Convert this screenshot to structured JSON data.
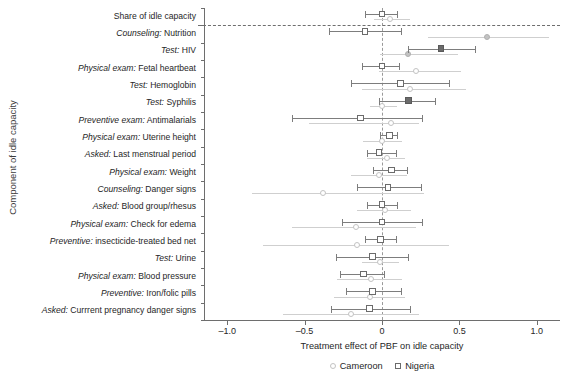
{
  "chart_data": {
    "type": "scatter",
    "title": "",
    "xlabel": "Treatment effect of PBF on idle capacity",
    "ylabel": "Component of idle capacity",
    "xlim": [
      -1.15,
      1.15
    ],
    "xticks": [
      -1.0,
      -0.5,
      0,
      0.5,
      1.0
    ],
    "xticklabels": [
      "–1.0",
      "–0.5",
      "0",
      "0.5",
      "1.0"
    ],
    "grid": false,
    "zero_reference_line": 0,
    "separator_after_category_index": 0,
    "legend_position": "bottom-center",
    "categories": [
      "Share of idle capacity",
      "Counseling: Nutrition",
      "Test: HIV",
      "Physical exam: Fetal heartbeat",
      "Test: Hemoglobin",
      "Test: Syphilis",
      "Preventive exam: Antimalarials",
      "Physical exam: Uterine height",
      "Asked: Last menstrual period",
      "Physical exam: Weight",
      "Counseling: Danger signs",
      "Asked: Blood group/rhesus",
      "Physical exam: Check for edema",
      "Preventive: insecticide-treated bed net",
      "Test: Urine",
      "Physical exam: Blood pressure",
      "Preventive: Iron/folic pills",
      "Asked: Currrent pregnancy danger signs"
    ],
    "category_prefixes": [
      "",
      "Counseling:",
      "Test:",
      "Physical exam:",
      "Test:",
      "Test:",
      "Preventive exam:",
      "Physical exam:",
      "Asked:",
      "Physical exam:",
      "Counseling:",
      "Asked:",
      "Physical exam:",
      "Preventive:",
      "Test:",
      "Physical exam:",
      "Preventive:",
      "Asked:"
    ],
    "category_suffixes": [
      "Share of idle capacity",
      " Nutrition",
      " HIV",
      " Fetal heartbeat",
      " Hemoglobin",
      " Syphilis",
      " Antimalarials",
      " Uterine height",
      " Last menstrual period",
      " Weight",
      " Danger signs",
      " Blood group/rhesus",
      " Check for edema",
      " insecticide-treated bed net",
      " Urine",
      " Blood pressure",
      " Iron/folic pills",
      " Currrent pregnancy danger signs"
    ],
    "series": [
      {
        "name": "Cameroon",
        "marker": "circle",
        "color": "#c2c2c2",
        "values": [
          0.05,
          0.68,
          0.17,
          0.22,
          0.18,
          0.0,
          0.06,
          0.0,
          0.03,
          -0.02,
          -0.38,
          0.02,
          -0.17,
          -0.16,
          -0.01,
          -0.07,
          -0.08,
          -0.2
        ],
        "ci_low": [
          -0.05,
          0.3,
          -0.01,
          -0.02,
          -0.13,
          -0.08,
          -0.47,
          -0.12,
          -0.1,
          -0.2,
          -0.84,
          -0.16,
          -0.58,
          -0.77,
          -0.13,
          -0.29,
          -0.31,
          -0.64
        ],
        "ci_high": [
          0.18,
          1.08,
          0.49,
          0.51,
          0.54,
          0.1,
          0.24,
          0.13,
          0.15,
          0.16,
          0.27,
          0.19,
          0.22,
          0.43,
          0.11,
          0.13,
          0.15,
          0.24
        ],
        "filled": [
          false,
          true,
          true,
          false,
          false,
          false,
          false,
          false,
          false,
          false,
          false,
          false,
          false,
          false,
          false,
          false,
          false,
          false
        ]
      },
      {
        "name": "Nigeria",
        "marker": "square",
        "color": "#6b6b6b",
        "values": [
          0.0,
          -0.11,
          0.38,
          0.0,
          0.12,
          0.17,
          -0.14,
          0.05,
          -0.02,
          0.06,
          0.04,
          0.0,
          0.0,
          -0.01,
          -0.06,
          -0.12,
          -0.06,
          -0.08
        ],
        "ci_low": [
          -0.11,
          -0.34,
          0.17,
          -0.13,
          -0.2,
          -0.02,
          -0.58,
          -0.01,
          -0.1,
          -0.06,
          -0.16,
          -0.1,
          -0.26,
          -0.11,
          -0.3,
          -0.27,
          -0.23,
          -0.33
        ],
        "ci_high": [
          0.1,
          0.12,
          0.6,
          0.11,
          0.43,
          0.34,
          0.26,
          0.1,
          0.09,
          0.16,
          0.25,
          0.1,
          0.26,
          0.09,
          0.17,
          0.01,
          0.12,
          0.18
        ],
        "filled": [
          false,
          false,
          true,
          false,
          false,
          true,
          false,
          false,
          false,
          false,
          false,
          false,
          false,
          false,
          false,
          false,
          false,
          false
        ]
      }
    ]
  },
  "legend": {
    "items": [
      {
        "label": "Cameroon",
        "marker": "circle-icon"
      },
      {
        "label": "Nigeria",
        "marker": "square-icon"
      }
    ]
  }
}
